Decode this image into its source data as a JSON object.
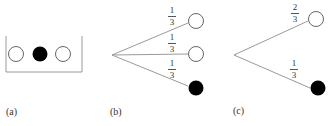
{
  "panels": {
    "a": {
      "label": "(a)",
      "description": "Urn containing three balls",
      "balls": [
        {
          "color": "white"
        },
        {
          "color": "black"
        },
        {
          "color": "white"
        }
      ]
    },
    "b": {
      "label": "(b)",
      "description": "Tree with three equally likely branches",
      "branches": [
        {
          "prob_num": "1",
          "prob_den": "3",
          "outcome": "white"
        },
        {
          "prob_num": "1",
          "prob_den": "3",
          "outcome": "white"
        },
        {
          "prob_num": "1",
          "prob_den": "3",
          "outcome": "black"
        }
      ]
    },
    "c": {
      "label": "(c)",
      "description": "Tree with two branches",
      "branches": [
        {
          "prob_num": "2",
          "prob_den": "3",
          "outcome": "white"
        },
        {
          "prob_num": "1",
          "prob_den": "3",
          "outcome": "black"
        }
      ]
    }
  },
  "colors": {
    "line": "#9a9a9a",
    "ball_outline": "#555555",
    "ball_black": "#000000",
    "ball_white": "#ffffff"
  }
}
